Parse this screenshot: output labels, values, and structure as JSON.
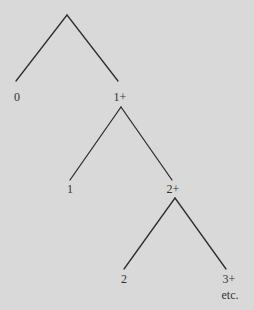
{
  "diagram": {
    "background": "#d9d9d9",
    "line_color": "#2e2e2e",
    "nodes": [
      {
        "id": "n0",
        "label": "0"
      },
      {
        "id": "n1plus",
        "label": "1+"
      },
      {
        "id": "n1",
        "label": "1"
      },
      {
        "id": "n2plus",
        "label": "2+"
      },
      {
        "id": "n2",
        "label": "2"
      },
      {
        "id": "n3plus",
        "label": "3+"
      },
      {
        "id": "etc",
        "label": "etc."
      }
    ],
    "edges": [
      [
        "root",
        "0"
      ],
      [
        "root",
        "1+"
      ],
      [
        "1+",
        "1"
      ],
      [
        "1+",
        "2+"
      ],
      [
        "2+",
        "2"
      ],
      [
        "2+",
        "3+"
      ]
    ]
  }
}
